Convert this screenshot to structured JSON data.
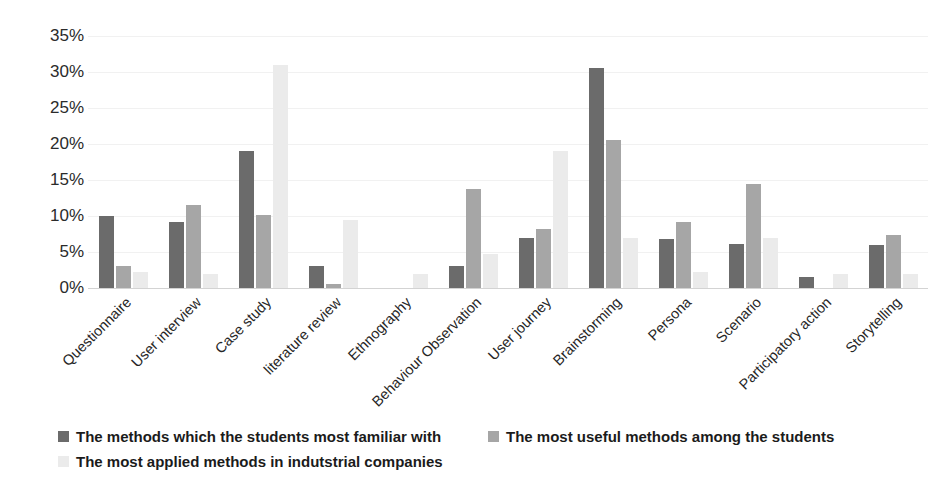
{
  "chart_data": {
    "type": "bar",
    "title": "",
    "subtitle": "",
    "xlabel": "",
    "ylabel": "",
    "ylim": [
      0,
      35
    ],
    "ytick_labels": [
      "35%",
      "30%",
      "25%",
      "20%",
      "15%",
      "10%",
      "5%",
      "0%"
    ],
    "ytick_values": [
      35,
      30,
      25,
      20,
      15,
      10,
      5,
      0
    ],
    "grid": true,
    "legend_position": "bottom-left",
    "categories": [
      "Questionnaire",
      "User interview",
      "Case study",
      "literature review",
      "Ethnography",
      "Behaviour Observation",
      "User journey",
      "Brainstorming",
      "Persona",
      "Scenario",
      "Participatory action",
      "Storytelling"
    ],
    "series": [
      {
        "name": "The methods which the students most familiar with",
        "color": "#6b6b6b",
        "values": [
          10.0,
          9.2,
          19.0,
          3.0,
          0.0,
          3.0,
          6.9,
          30.5,
          6.8,
          6.1,
          1.5,
          6.0
        ]
      },
      {
        "name": "The most useful methods among the students",
        "color": "#a6a6a6",
        "values": [
          3.0,
          11.5,
          10.2,
          0.6,
          0.0,
          13.7,
          8.2,
          20.5,
          9.2,
          14.4,
          0.0,
          7.3
        ]
      },
      {
        "name": "The most applied methods in indutstrial companies",
        "color": "#ebebeb",
        "values": [
          2.2,
          2.0,
          31.0,
          9.5,
          2.0,
          4.7,
          19.0,
          7.0,
          2.2,
          7.0,
          2.0,
          2.0
        ]
      }
    ]
  },
  "legend": {
    "items": [
      {
        "label": "The methods which the students most familiar with",
        "swatch": "s0"
      },
      {
        "label": "The most useful methods among the students",
        "swatch": "s1"
      },
      {
        "label": "The most applied methods in indutstrial companies",
        "swatch": "s2"
      }
    ]
  }
}
